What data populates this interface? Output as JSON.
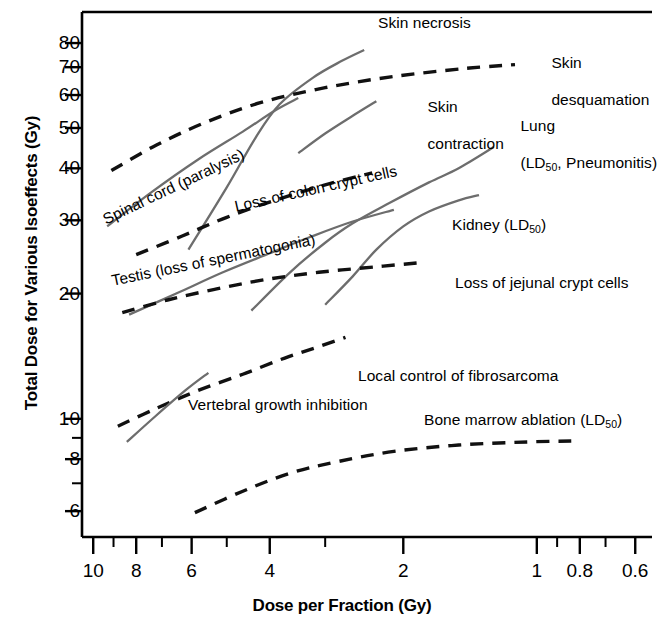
{
  "chart_data": {
    "type": "line",
    "title": "",
    "xlabel": "Dose per Fraction (Gy)",
    "ylabel": "Total Dose for Various Isoeffects (Gy)",
    "xscale": "log-reversed",
    "yscale": "log",
    "xlim": [
      10.6,
      0.55
    ],
    "ylim": [
      5.2,
      95
    ],
    "grid": false,
    "legend": "inline-annotations",
    "xticks_major": [
      "10",
      "8",
      "6",
      "4",
      "2",
      "1",
      "0.8",
      "0.6"
    ],
    "xticks_minor": [
      10,
      9,
      8,
      7,
      6,
      5,
      4,
      3,
      2,
      1,
      0.9,
      0.8,
      0.7,
      0.6
    ],
    "yticks_major": [
      "80",
      "70",
      "60",
      "50",
      "40",
      "30",
      "20",
      "10",
      "8",
      "6"
    ],
    "yticks_minor": [
      80,
      70,
      60,
      50,
      40,
      30,
      20,
      10,
      9,
      8,
      7,
      6
    ],
    "series": [
      {
        "name": "Skin necrosis",
        "style": "solid",
        "points": [
          [
            6.1,
            25.5
          ],
          [
            5.0,
            36.0
          ],
          [
            4.3,
            47.5
          ],
          [
            3.8,
            57.0
          ],
          [
            3.2,
            66.0
          ],
          [
            2.75,
            72.5
          ],
          [
            2.45,
            77.0
          ]
        ]
      },
      {
        "name": "Skin desquamation",
        "style": "dashed",
        "points": [
          [
            9.1,
            39.5
          ],
          [
            7.2,
            45.5
          ],
          [
            5.6,
            51.5
          ],
          [
            4.2,
            57.5
          ],
          [
            3.0,
            62.5
          ],
          [
            2.1,
            66.5
          ],
          [
            1.45,
            69.5
          ],
          [
            1.12,
            71.0
          ]
        ]
      },
      {
        "name": "Skin contraction",
        "style": "solid",
        "points": [
          [
            3.45,
            43.5
          ],
          [
            3.0,
            48.5
          ],
          [
            2.6,
            53.5
          ],
          [
            2.3,
            58.0
          ]
        ]
      },
      {
        "name": "Spinal cord (paralysis)",
        "style": "solid",
        "points": [
          [
            9.3,
            29.0
          ],
          [
            7.4,
            35.0
          ],
          [
            5.8,
            42.0
          ],
          [
            4.6,
            49.0
          ],
          [
            3.9,
            55.0
          ],
          [
            3.45,
            59.0
          ]
        ]
      },
      {
        "name": "Loss of colon crypt cells",
        "style": "dashed",
        "points": [
          [
            8.0,
            24.8
          ],
          [
            6.3,
            27.5
          ],
          [
            5.0,
            30.5
          ],
          [
            3.9,
            33.5
          ],
          [
            3.0,
            36.5
          ],
          [
            2.35,
            39.0
          ]
        ]
      },
      {
        "name": "Lung (LD50, Pneumonitis)",
        "style": "solid",
        "points": [
          [
            4.4,
            18.2
          ],
          [
            3.6,
            22.5
          ],
          [
            3.0,
            26.5
          ],
          [
            2.6,
            29.5
          ],
          [
            2.15,
            33.0
          ],
          [
            1.75,
            37.0
          ],
          [
            1.5,
            40.0
          ],
          [
            1.25,
            45.0
          ]
        ]
      },
      {
        "name": "Testis (loss of spermatogonia)",
        "style": "solid",
        "points": [
          [
            8.3,
            17.8
          ],
          [
            6.5,
            20.0
          ],
          [
            5.1,
            22.5
          ],
          [
            4.0,
            25.0
          ],
          [
            3.2,
            27.5
          ],
          [
            2.6,
            29.8
          ],
          [
            2.1,
            31.8
          ]
        ]
      },
      {
        "name": "Kidney (LD50)",
        "style": "solid",
        "points": [
          [
            3.0,
            18.8
          ],
          [
            2.6,
            22.0
          ],
          [
            2.3,
            25.5
          ],
          [
            2.0,
            29.0
          ],
          [
            1.75,
            31.5
          ],
          [
            1.5,
            33.5
          ],
          [
            1.35,
            34.5
          ]
        ]
      },
      {
        "name": "Loss of jejunal crypt cells",
        "style": "dashed",
        "points": [
          [
            8.6,
            18.0
          ],
          [
            6.8,
            19.3
          ],
          [
            5.3,
            20.5
          ],
          [
            4.1,
            21.6
          ],
          [
            3.1,
            22.5
          ],
          [
            2.3,
            23.2
          ],
          [
            1.85,
            23.7
          ]
        ]
      },
      {
        "name": "Local control of fibrosarcoma",
        "style": "dashed",
        "points": [
          [
            8.8,
            9.6
          ],
          [
            7.2,
            10.6
          ],
          [
            5.8,
            11.7
          ],
          [
            4.6,
            12.8
          ],
          [
            3.7,
            14.0
          ],
          [
            3.05,
            15.0
          ],
          [
            2.7,
            15.7
          ]
        ]
      },
      {
        "name": "Vertebral growth inhibition",
        "style": "solid",
        "points": [
          [
            8.4,
            8.8
          ],
          [
            7.2,
            10.2
          ],
          [
            6.2,
            11.7
          ],
          [
            5.5,
            12.9
          ]
        ]
      },
      {
        "name": "Bone marrow ablation (LD50)",
        "style": "dashed",
        "points": [
          [
            5.9,
            5.95
          ],
          [
            4.6,
            6.7
          ],
          [
            3.6,
            7.4
          ],
          [
            2.8,
            7.9
          ],
          [
            2.1,
            8.35
          ],
          [
            1.5,
            8.65
          ],
          [
            1.05,
            8.8
          ],
          [
            0.82,
            8.85
          ]
        ]
      }
    ],
    "annotations": [
      {
        "name": "skin-necrosis",
        "text": "Skin necrosis"
      },
      {
        "name": "skin-desquamation",
        "text": "Skin\ndesquamation"
      },
      {
        "name": "skin-contraction",
        "text": "Skin\ncontraction"
      },
      {
        "name": "lung",
        "text": "Lung\n(LD50, Pneumonitis)"
      },
      {
        "name": "spinal-cord",
        "text": "Spinal cord (paralysis)"
      },
      {
        "name": "loss-of-colon-crypt-cells",
        "text": "Loss of colon crypt cells"
      },
      {
        "name": "testis",
        "text": "Testis (loss of spermatogonia)"
      },
      {
        "name": "kidney",
        "text": "Kidney (LD50)"
      },
      {
        "name": "loss-of-jejunal-crypt-cells",
        "text": "Loss of jejunal crypt cells"
      },
      {
        "name": "local-control-of-fibrosarcoma",
        "text": "Local control of fibrosarcoma"
      },
      {
        "name": "vertebral-growth-inhibition",
        "text": "Vertebral growth inhibition"
      },
      {
        "name": "bone-marrow-ablation",
        "text": "Bone marrow ablation (LD50)"
      }
    ]
  },
  "axes": {
    "y_title": "Total Dose for Various Isoeffects (Gy)",
    "x_title": "Dose per Fraction (Gy)",
    "y_labels": [
      "80",
      "70",
      "60",
      "50",
      "40",
      "30",
      "20",
      "10",
      "8",
      "6"
    ],
    "x_labels": [
      "10",
      "8",
      "6",
      "4",
      "2",
      "1",
      "0.8",
      "0.6"
    ]
  },
  "labels": {
    "skin_necrosis": "Skin necrosis",
    "skin_desquamation_l1": "Skin",
    "skin_desquamation_l2": "desquamation",
    "skin_contraction_l1": "Skin",
    "skin_contraction_l2": "contraction",
    "lung_l1": "Lung",
    "lung_pre": "(LD",
    "lung_sub": "50",
    "lung_post": ", Pneumonitis)",
    "spinal_cord": "Spinal cord (paralysis)",
    "colon_crypt": "Loss of colon crypt cells",
    "testis": "Testis (loss of spermatogonia)",
    "kidney_pre": "Kidney (LD",
    "kidney_sub": "50",
    "kidney_post": ")",
    "jejunal_crypt": "Loss of jejunal crypt cells",
    "fibrosarcoma": "Local control of fibrosarcoma",
    "vertebral": "Vertebral growth inhibition",
    "bone_marrow_pre": "Bone marrow ablation (LD",
    "bone_marrow_sub": "50",
    "bone_marrow_post": ")"
  },
  "colors": {
    "axis": "#000000",
    "curve_solid": "#6d6d6d",
    "curve_dashed": "#111111",
    "text": "#000000",
    "background": "#ffffff"
  }
}
